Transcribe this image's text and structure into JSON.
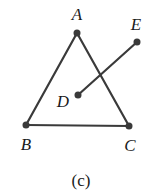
{
  "figure": {
    "caption": "(c)",
    "points": {
      "A": {
        "label": "A",
        "x": 77,
        "y": 33,
        "label_x": 77,
        "label_y": 20
      },
      "B": {
        "label": "B",
        "x": 26,
        "y": 125,
        "label_x": 26,
        "label_y": 150
      },
      "C": {
        "label": "C",
        "x": 129,
        "y": 126,
        "label_x": 130,
        "label_y": 151
      },
      "D": {
        "label": "D",
        "x": 78,
        "y": 95,
        "label_x": 63,
        "label_y": 107
      },
      "E": {
        "label": "E",
        "x": 137,
        "y": 42,
        "label_x": 136,
        "label_y": 30
      }
    },
    "segments": [
      {
        "from": "A",
        "to": "B"
      },
      {
        "from": "A",
        "to": "C"
      },
      {
        "from": "B",
        "to": "C"
      },
      {
        "from": "D",
        "to": "E"
      }
    ],
    "colors": {
      "stroke": "#3a3a3a",
      "text": "#1a1a1a",
      "background": "#ffffff"
    }
  }
}
